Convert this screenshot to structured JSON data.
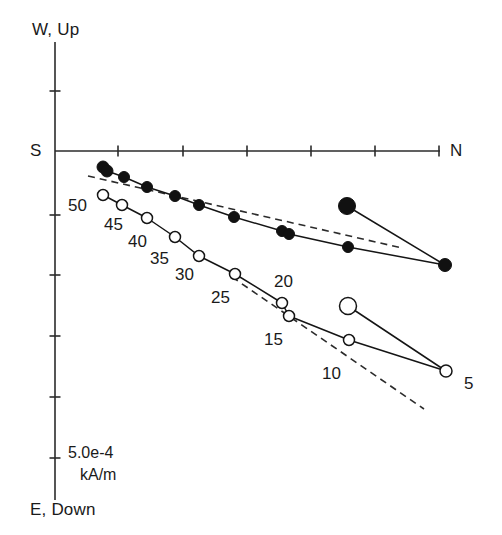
{
  "figure": {
    "kind": "zijderveld-orthogonal-projection",
    "background": "#ffffff",
    "ink_color": "#151515"
  },
  "axes": {
    "top_label": "W, Up",
    "bottom_label": "E, Down",
    "left_label": "S",
    "right_label": "N",
    "origin": {
      "x": 55,
      "y": 151
    },
    "vertical_axis": {
      "x": 55,
      "y_top": 42,
      "y_bottom": 500
    },
    "horizontal_axis": {
      "y": 151,
      "x_left": 55,
      "x_right": 440
    },
    "vertical_ticks_y": [
      91,
      215,
      275,
      336,
      397,
      458
    ],
    "horizontal_ticks_x": [
      118,
      183,
      247,
      311,
      375,
      439
    ],
    "tick_length": 11
  },
  "scale_bar": {
    "value_text": "5.0e-4",
    "unit_text": "kA/m"
  },
  "chart_data": {
    "type": "scatter",
    "title": "",
    "xlabel": "S → N (horizontal component)",
    "ylabel": "W, Up → E, Down (vertical component)",
    "grid": false,
    "legend": "none",
    "series": [
      {
        "name": "horizontal-projection",
        "marker": "filled-circle",
        "points": [
          {
            "label": "50",
            "x": 103,
            "y": 167,
            "r": 6.0
          },
          {
            "label": "",
            "x": 107,
            "y": 171,
            "r": 6.0
          },
          {
            "label": "45",
            "x": 124,
            "y": 177,
            "r": 5.5
          },
          {
            "label": "40",
            "x": 147,
            "y": 187,
            "r": 5.5
          },
          {
            "label": "35",
            "x": 175,
            "y": 196,
            "r": 5.5
          },
          {
            "label": "30",
            "x": 199,
            "y": 205,
            "r": 5.5
          },
          {
            "label": "25",
            "x": 234,
            "y": 217,
            "r": 5.5
          },
          {
            "label": "20",
            "x": 282,
            "y": 231,
            "r": 5.5
          },
          {
            "label": "",
            "x": 289,
            "y": 234,
            "r": 5.5
          },
          {
            "label": "15",
            "x": 348,
            "y": 247,
            "r": 5.5
          },
          {
            "label": "10",
            "x": 347,
            "y": 206,
            "r": 8.5
          },
          {
            "label": "5",
            "x": 445,
            "y": 265,
            "r": 6.5
          }
        ],
        "path_order": [
          0,
          1,
          2,
          3,
          4,
          5,
          6,
          7,
          8,
          9,
          11,
          10
        ]
      },
      {
        "name": "vertical-projection",
        "marker": "open-circle",
        "points": [
          {
            "label": "50",
            "x": 103,
            "y": 195,
            "r": 5.5
          },
          {
            "label": "45",
            "x": 122,
            "y": 205,
            "r": 5.5
          },
          {
            "label": "40",
            "x": 147,
            "y": 218,
            "r": 5.5
          },
          {
            "label": "35",
            "x": 175,
            "y": 237,
            "r": 5.5
          },
          {
            "label": "30",
            "x": 199,
            "y": 256,
            "r": 5.5
          },
          {
            "label": "25",
            "x": 235,
            "y": 274,
            "r": 5.5
          },
          {
            "label": "20",
            "x": 282,
            "y": 303,
            "r": 5.5
          },
          {
            "label": "",
            "x": 289,
            "y": 316,
            "r": 5.5
          },
          {
            "label": "15",
            "x": 349,
            "y": 340,
            "r": 5.5
          },
          {
            "label": "10",
            "x": 348,
            "y": 306,
            "r": 8.5
          },
          {
            "label": "5",
            "x": 446,
            "y": 371,
            "r": 6.0
          }
        ],
        "path_order": [
          0,
          1,
          2,
          3,
          4,
          5,
          6,
          7,
          8,
          10,
          9
        ]
      }
    ],
    "fit_lines": [
      {
        "name": "upper-fit-line",
        "x1": 88,
        "y1": 176,
        "x2": 402,
        "y2": 248
      },
      {
        "name": "lower-fit-line",
        "x1": 232,
        "y1": 277,
        "x2": 424,
        "y2": 409
      }
    ],
    "step_labels": [
      {
        "text": "50",
        "x": 68,
        "y": 196
      },
      {
        "text": "45",
        "x": 104,
        "y": 215
      },
      {
        "text": "40",
        "x": 128,
        "y": 232
      },
      {
        "text": "35",
        "x": 150,
        "y": 249
      },
      {
        "text": "30",
        "x": 175,
        "y": 265
      },
      {
        "text": "25",
        "x": 211,
        "y": 288
      },
      {
        "text": "20",
        "x": 274,
        "y": 272
      },
      {
        "text": "15",
        "x": 264,
        "y": 330
      },
      {
        "text": "10",
        "x": 322,
        "y": 364
      },
      {
        "text": "5",
        "x": 464,
        "y": 374
      }
    ]
  }
}
